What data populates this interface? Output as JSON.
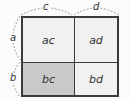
{
  "diagram": {
    "type": "area-model",
    "dimensions": {
      "top": [
        {
          "label": "c"
        },
        {
          "label": "d"
        }
      ],
      "left": [
        {
          "label": "a"
        },
        {
          "label": "b"
        }
      ]
    },
    "cells": [
      {
        "row": 0,
        "col": 0,
        "label": "ac",
        "shaded": false
      },
      {
        "row": 0,
        "col": 1,
        "label": "ad",
        "shaded": false
      },
      {
        "row": 1,
        "col": 0,
        "label": "bc",
        "shaded": true
      },
      {
        "row": 1,
        "col": 1,
        "label": "bd",
        "shaded": false
      }
    ],
    "colors": {
      "border": "#3a3a3a",
      "cell_fill": "#f1f1f1",
      "shaded_fill": "#c9c9c9",
      "background": "#fbfbfb",
      "dash": "#888888"
    }
  }
}
